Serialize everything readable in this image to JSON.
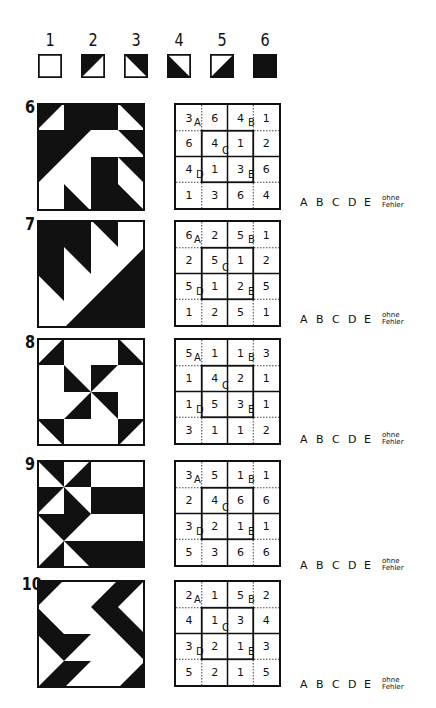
{
  "legend": [
    {
      "num": "1",
      "type": 1
    },
    {
      "num": "2",
      "type": 2
    },
    {
      "num": "3",
      "type": 3
    },
    {
      "num": "4",
      "type": 4
    },
    {
      "num": "5",
      "type": 5
    },
    {
      "num": "6",
      "type": 6
    }
  ],
  "puzzles": [
    {
      "num": "6",
      "top": 103,
      "picture": [
        [
          2,
          6,
          6,
          3
        ],
        [
          6,
          2,
          1,
          3
        ],
        [
          2,
          1,
          6,
          3
        ],
        [
          1,
          4,
          6,
          4
        ]
      ],
      "grid": [
        [
          3,
          6,
          4,
          1
        ],
        [
          6,
          4,
          1,
          2
        ],
        [
          4,
          1,
          3,
          6
        ],
        [
          1,
          3,
          6,
          4
        ]
      ]
    },
    {
      "num": "7",
      "top": 220,
      "picture": [
        [
          6,
          6,
          3,
          1
        ],
        [
          6,
          3,
          1,
          5
        ],
        [
          3,
          1,
          5,
          6
        ],
        [
          1,
          5,
          6,
          6
        ]
      ],
      "grid": [
        [
          6,
          2,
          5,
          1
        ],
        [
          2,
          5,
          1,
          2
        ],
        [
          5,
          1,
          2,
          5
        ],
        [
          1,
          2,
          5,
          1
        ]
      ]
    },
    {
      "num": "8",
      "top": 338,
      "picture": [
        [
          5,
          1,
          1,
          4
        ],
        [
          1,
          4,
          2,
          1
        ],
        [
          1,
          5,
          3,
          1
        ],
        [
          3,
          1,
          1,
          2
        ]
      ],
      "grid": [
        [
          5,
          1,
          1,
          3
        ],
        [
          1,
          4,
          2,
          1
        ],
        [
          1,
          5,
          3,
          1
        ],
        [
          3,
          1,
          1,
          2
        ]
      ]
    },
    {
      "num": "9",
      "top": 460,
      "picture": [
        [
          3,
          5,
          1,
          1
        ],
        [
          2,
          4,
          6,
          6
        ],
        [
          3,
          2,
          1,
          1
        ],
        [
          5,
          3,
          6,
          6
        ]
      ],
      "grid": [
        [
          3,
          5,
          1,
          1
        ],
        [
          2,
          4,
          6,
          6
        ],
        [
          3,
          2,
          1,
          1
        ],
        [
          5,
          3,
          6,
          6
        ]
      ]
    },
    {
      "num": "10",
      "top": 580,
      "picture": [
        [
          2,
          1,
          5,
          2
        ],
        [
          4,
          1,
          3,
          4
        ],
        [
          3,
          2,
          1,
          3
        ],
        [
          5,
          2,
          1,
          5
        ]
      ],
      "grid": [
        [
          2,
          1,
          5,
          2
        ],
        [
          4,
          1,
          3,
          4
        ],
        [
          3,
          2,
          1,
          3
        ],
        [
          5,
          2,
          1,
          5
        ]
      ]
    }
  ],
  "grid_labels": {
    "a": "A",
    "b": "B",
    "c": "C",
    "d": "D",
    "e": "E"
  },
  "answers": {
    "options": [
      "A",
      "B",
      "C",
      "D",
      "E"
    ],
    "no_error_line1": "ohne",
    "no_error_line2": "Fehler",
    "rows_top": [
      195,
      312,
      432,
      558,
      677
    ]
  },
  "colors": {
    "ink": "#111111",
    "paper": "#ffffff"
  }
}
